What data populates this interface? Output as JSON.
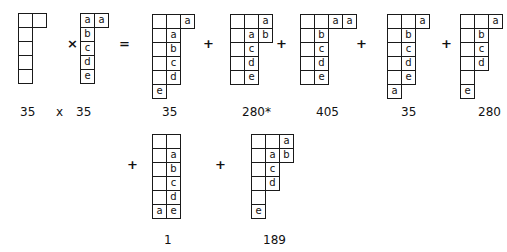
{
  "operators": {
    "times": "×",
    "equals": "=",
    "plus": "+"
  },
  "tableaux": [
    {
      "id": "lhs-1",
      "dimension": "35",
      "rows": [
        [
          "",
          ""
        ],
        [
          ""
        ],
        [
          ""
        ],
        [
          ""
        ],
        [
          ""
        ]
      ]
    },
    {
      "id": "lhs-2",
      "dimension": "35",
      "rows": [
        [
          "a",
          "a"
        ],
        [
          "b"
        ],
        [
          "c"
        ],
        [
          "d"
        ],
        [
          "e"
        ]
      ]
    },
    {
      "id": "result-1",
      "dimension": "35",
      "merged_empty": true,
      "rows": [
        [
          "",
          "",
          "a"
        ],
        [
          "",
          "a"
        ],
        [
          "",
          "b"
        ],
        [
          "",
          "c"
        ],
        [
          "",
          "d"
        ],
        [
          "e"
        ]
      ]
    },
    {
      "id": "result-2",
      "dimension": "280*",
      "rows": [
        [
          "",
          "",
          "a"
        ],
        [
          "",
          "a",
          "b"
        ],
        [
          "",
          "c"
        ],
        [
          "",
          "d"
        ],
        [
          "",
          "e"
        ]
      ]
    },
    {
      "id": "result-3",
      "dimension": "405",
      "rows": [
        [
          "",
          "",
          "a",
          "a"
        ],
        [
          "",
          "b"
        ],
        [
          "",
          "c"
        ],
        [
          "",
          "d"
        ],
        [
          "",
          "e"
        ]
      ]
    },
    {
      "id": "result-4",
      "dimension": "35",
      "rows": [
        [
          "",
          "",
          "a"
        ],
        [
          "",
          "b"
        ],
        [
          "",
          "c"
        ],
        [
          "",
          "d"
        ],
        [
          "",
          "e"
        ],
        [
          "a"
        ]
      ]
    },
    {
      "id": "result-5",
      "dimension": "280",
      "rows": [
        [
          "",
          "",
          "a"
        ],
        [
          "",
          "b"
        ],
        [
          "",
          "c"
        ],
        [
          "",
          "d"
        ],
        [
          ""
        ],
        [
          "e"
        ]
      ]
    },
    {
      "id": "result-6",
      "dimension": "1",
      "rows": [
        [
          "",
          ""
        ],
        [
          "",
          "a"
        ],
        [
          "",
          "b"
        ],
        [
          "",
          "c"
        ],
        [
          "",
          "d"
        ],
        [
          "a",
          "e"
        ]
      ]
    },
    {
      "id": "result-7",
      "dimension": "189",
      "rows": [
        [
          "",
          "",
          "a"
        ],
        [
          "",
          "a",
          "b"
        ],
        [
          "",
          "c"
        ],
        [
          "",
          "d"
        ],
        [
          ""
        ],
        [
          "e"
        ]
      ]
    }
  ],
  "labels": {
    "lhs": [
      "35",
      "x",
      "35"
    ]
  }
}
